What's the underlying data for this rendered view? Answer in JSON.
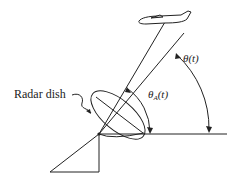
{
  "diagram": {
    "labels": {
      "radar_dish": "Radar dish",
      "theta_a_symbol": "θ",
      "theta_a_subscript": "A",
      "theta_a_arg": "(t)",
      "theta": "θ(t)"
    },
    "elements": [
      "aircraft",
      "antenna-pointing-line",
      "line-of-sight-to-target",
      "horizontal-reference-line",
      "radar-dish",
      "dish-support-base",
      "theta-a-angle-arc",
      "theta-angle-arc"
    ],
    "colors": {
      "stroke": "#222222",
      "background": "#ffffff"
    }
  }
}
